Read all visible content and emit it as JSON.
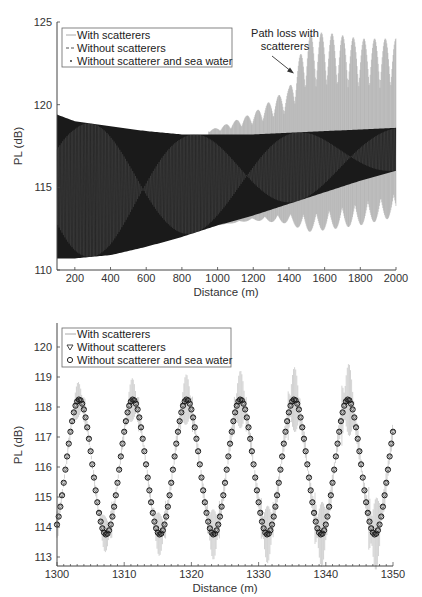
{
  "chart_data": [
    {
      "type": "line",
      "panel": "top",
      "title": "",
      "xlabel": "Distance (m)",
      "ylabel": "PL (dB)",
      "xlim": [
        100,
        2000
      ],
      "ylim": [
        110,
        125
      ],
      "xticks": [
        200,
        400,
        600,
        800,
        1000,
        1200,
        1400,
        1600,
        1800,
        2000
      ],
      "yticks": [
        110,
        115,
        120,
        125
      ],
      "grid": false,
      "legend_position": "upper left",
      "legend": [
        "With scatterers",
        "Without scatterers",
        "Without scatterer and sea water"
      ],
      "annotation": {
        "text_line1": "Path loss with",
        "text_line2": "scatterers",
        "arrow_to": [
          1450,
          122
        ]
      },
      "series": [
        {
          "name": "With scatterers",
          "color": "#9a9a9a",
          "style": "solid",
          "envelope_x": [
            100,
            400,
            800,
            1000,
            1200,
            1400,
            1500,
            1600,
            1800,
            2000
          ],
          "envelope_upper": [
            119.4,
            118.8,
            118.2,
            118.6,
            119.5,
            121.0,
            124.2,
            124.4,
            124.0,
            124.0
          ],
          "envelope_lower": [
            110.7,
            110.7,
            112.2,
            112.7,
            113.0,
            112.8,
            112.3,
            112.4,
            112.7,
            113.2
          ]
        },
        {
          "name": "Without scatterers",
          "color": "#333333",
          "style": "dashed",
          "envelope_x": [
            100,
            200,
            400,
            600,
            800,
            1000,
            1200,
            1400,
            1600,
            1800,
            2000
          ],
          "envelope_upper": [
            119.4,
            119.0,
            118.7,
            118.4,
            118.2,
            118.2,
            118.2,
            118.3,
            118.4,
            118.5,
            118.6
          ],
          "envelope_lower": [
            110.7,
            110.7,
            110.9,
            111.4,
            112.0,
            112.7,
            113.3,
            114.0,
            114.7,
            115.4,
            116.0
          ]
        },
        {
          "name": "Without scatterer and sea water",
          "color": "#000000",
          "style": "dotted",
          "envelope_x": [
            100,
            200,
            400,
            600,
            800,
            1000,
            1200,
            1400,
            1600,
            1800,
            2000
          ],
          "envelope_upper": [
            119.4,
            119.0,
            118.7,
            118.4,
            118.2,
            118.2,
            118.2,
            118.3,
            118.4,
            118.5,
            118.6
          ],
          "envelope_lower": [
            110.7,
            110.7,
            110.9,
            111.4,
            112.0,
            112.7,
            113.3,
            114.0,
            114.7,
            115.4,
            116.0
          ]
        }
      ]
    },
    {
      "type": "line",
      "panel": "bottom",
      "title": "",
      "xlabel": "Distance (m)",
      "ylabel": "PL (dB)",
      "xlim": [
        1300,
        1350
      ],
      "ylim": [
        112.7,
        120.8
      ],
      "xticks": [
        1300,
        1310,
        1320,
        1330,
        1340,
        1350
      ],
      "yticks": [
        113,
        114,
        115,
        116,
        117,
        118,
        119,
        120
      ],
      "grid": false,
      "legend_position": "upper left",
      "legend": [
        "With scatterers",
        "Without scatterers",
        "Without scatterer and sea water"
      ],
      "series": [
        {
          "name": "With scatterers",
          "color": "#9a9a9a",
          "style": "solid",
          "peaks_x": [
            1303.4,
            1311.2,
            1319.2,
            1327.2,
            1335.2,
            1343.3
          ],
          "peaks_max": [
            119.4,
            119.3,
            119.4,
            120.1,
            120.6,
            120.7
          ],
          "troughs_x": [
            1307.2,
            1315.2,
            1323.2,
            1331.2,
            1339.3,
            1347.4
          ],
          "troughs_min": [
            113.2,
            113.3,
            113.1,
            112.8,
            112.7,
            112.7
          ],
          "end_value": 118.6
        },
        {
          "name": "Without scatterers",
          "color": "#333333",
          "marker": "triangle-down",
          "period_m": 8.0,
          "max": 118.25,
          "min": 113.75,
          "start_value": 113.9,
          "end_value": 116.7
        },
        {
          "name": "Without scatterer and sea water",
          "color": "#111111",
          "marker": "circle",
          "period_m": 8.0,
          "max": 118.25,
          "min": 113.75,
          "start_value": 113.9,
          "end_value": 116.7,
          "peaks_x": [
            1303.3,
            1311.3,
            1319.3,
            1327.3,
            1335.3,
            1343.3
          ],
          "troughs_x": [
            1307.3,
            1315.3,
            1323.3,
            1331.3,
            1339.3,
            1347.3
          ]
        }
      ]
    }
  ],
  "top": {
    "ylabel": "PL (dB)",
    "xlabel": "Distance (m)",
    "xticks": [
      "200",
      "400",
      "600",
      "800",
      "1000",
      "1200",
      "1400",
      "1600",
      "1800",
      "2000"
    ],
    "yticks": [
      "110",
      "115",
      "120",
      "125"
    ],
    "legend": [
      "With scatterers",
      "Without scatterers",
      "Without scatterer and sea water"
    ],
    "annotation_line1": "Path loss with",
    "annotation_line2": "scatterers"
  },
  "bottom": {
    "ylabel": "PL (dB)",
    "xlabel": "Distance (m)",
    "xticks": [
      "1300",
      "1310",
      "1320",
      "1330",
      "1340",
      "1350"
    ],
    "yticks": [
      "113",
      "114",
      "115",
      "116",
      "117",
      "118",
      "119",
      "120"
    ],
    "legend": [
      "With scatterers",
      "Without scatterers",
      "Without scatterer and sea water"
    ]
  },
  "colors": {
    "scatter_line": "#9a9a9a",
    "model": "#111111",
    "axis": "#444444"
  }
}
